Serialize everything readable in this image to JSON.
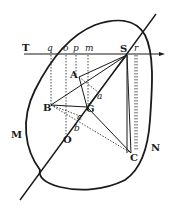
{
  "diagram": {
    "type": "geometric-figure",
    "colors": {
      "ink": "#1a1a1a",
      "background": "#ffffff"
    },
    "labels": {
      "T": "T",
      "q": "q",
      "o_top": "o",
      "p": "p",
      "m": "m",
      "S": "S",
      "r": "r",
      "A": "A",
      "a": "a",
      "B": "B",
      "G": "G",
      "c": "c",
      "b": "b",
      "O": "O",
      "C": "C",
      "M": "M",
      "N": "N"
    },
    "points": {
      "S": [
        127,
        55
      ],
      "A": [
        79,
        77
      ],
      "a": [
        98,
        92
      ],
      "B": [
        51,
        105
      ],
      "G": [
        87,
        107
      ],
      "c": [
        80,
        116
      ],
      "b": [
        77,
        125
      ],
      "O": [
        65,
        137
      ],
      "C": [
        131,
        153
      ],
      "q": [
        51,
        55
      ],
      "o_top": [
        66,
        55
      ],
      "p": [
        76,
        55
      ],
      "m": [
        88,
        55
      ],
      "r": [
        136,
        55
      ]
    }
  }
}
